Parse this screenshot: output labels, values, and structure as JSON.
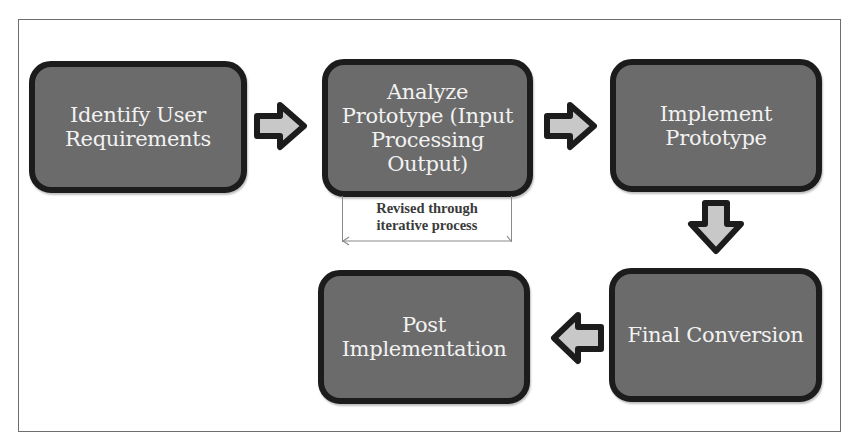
{
  "diagram": {
    "type": "process-flow",
    "colors": {
      "box_fill": "#6b6b6b",
      "box_border": "#1c1c1c",
      "box_text": "#f2f2f2",
      "arrow_fill": "#c8c8c8",
      "arrow_border": "#1c1c1c",
      "frame_border": "#6e6e6e",
      "note_text": "#3a3a3a"
    },
    "steps": [
      {
        "id": "identify",
        "label": "Identify User Requirements"
      },
      {
        "id": "analyze",
        "label": "Analyze Prototype (Input Processing Output)"
      },
      {
        "id": "implement",
        "label": "Implement Prototype"
      },
      {
        "id": "final",
        "label": "Final Conversion"
      },
      {
        "id": "post",
        "label": "Post Implementation"
      }
    ],
    "arrows": [
      {
        "from": "identify",
        "to": "analyze",
        "direction": "right"
      },
      {
        "from": "analyze",
        "to": "implement",
        "direction": "right"
      },
      {
        "from": "implement",
        "to": "final",
        "direction": "down"
      },
      {
        "from": "final",
        "to": "post",
        "direction": "left"
      }
    ],
    "note": {
      "attached_to": "analyze",
      "line1": "Revised through",
      "line2": "iterative process"
    }
  }
}
